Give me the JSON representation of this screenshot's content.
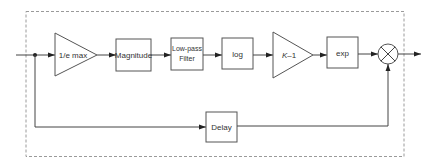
{
  "diagram": {
    "type": "signal-flow block diagram",
    "colors": {
      "line": "#444444",
      "block_border": "#555555",
      "frame": "#9a9a9a",
      "text": "#333333"
    },
    "blocks": {
      "gain_1": {
        "shape": "triangle",
        "label": "1/e max"
      },
      "magnitude": {
        "shape": "box",
        "label": "Magnitude"
      },
      "lowpass": {
        "shape": "box",
        "label_line1": "Low-pass",
        "label_line2": "Filter"
      },
      "log": {
        "shape": "box",
        "label": "log"
      },
      "gain_k": {
        "shape": "triangle",
        "label_var": "K",
        "label_rest": "–1"
      },
      "exp": {
        "shape": "box",
        "label": "exp"
      },
      "multiplier": {
        "shape": "circle-x",
        "label": ""
      },
      "delay": {
        "shape": "box",
        "label": "Delay"
      }
    },
    "connections": [
      [
        "input",
        "junction"
      ],
      [
        "junction",
        "gain_1"
      ],
      [
        "gain_1",
        "magnitude"
      ],
      [
        "magnitude",
        "lowpass"
      ],
      [
        "lowpass",
        "log"
      ],
      [
        "log",
        "gain_k"
      ],
      [
        "gain_k",
        "exp"
      ],
      [
        "exp",
        "multiplier"
      ],
      [
        "junction",
        "delay"
      ],
      [
        "delay",
        "multiplier"
      ],
      [
        "multiplier",
        "output"
      ]
    ]
  }
}
